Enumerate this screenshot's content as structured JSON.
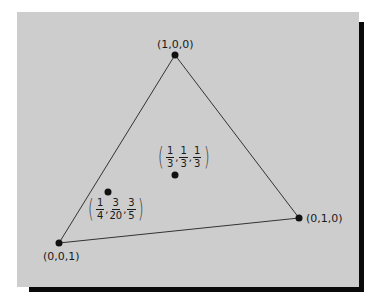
{
  "diagram": {
    "type": "barycentric-coordinates-triangle",
    "vertices": [
      {
        "id": "top",
        "label": "(1,0,0)",
        "x": 175,
        "y": 55
      },
      {
        "id": "right",
        "label": "(0,1,0)",
        "x": 299,
        "y": 218
      },
      {
        "id": "left",
        "label": "(0,0,1)",
        "x": 59,
        "y": 243
      }
    ],
    "interior_points": [
      {
        "id": "centroid",
        "x": 175,
        "y": 175,
        "coords": [
          {
            "num": "1",
            "den": "3"
          },
          {
            "num": "1",
            "den": "3"
          },
          {
            "num": "1",
            "den": "3"
          }
        ]
      },
      {
        "id": "point-b",
        "x": 108,
        "y": 192,
        "coords": [
          {
            "num": "1",
            "den": "4"
          },
          {
            "num": "3",
            "den": "20"
          },
          {
            "num": "3",
            "den": "5"
          }
        ]
      }
    ],
    "colors": {
      "panel": "#cdcdcd",
      "shadow": "#0a0a0a",
      "line": "#333333",
      "point": "#111111"
    }
  }
}
